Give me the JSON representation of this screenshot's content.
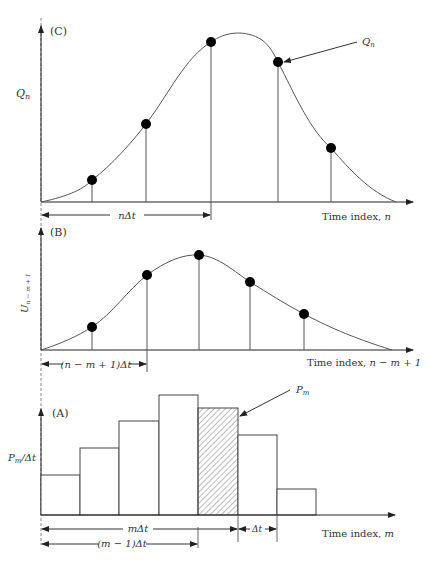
{
  "panels": {
    "C": {
      "label": "(C)",
      "y_axis_label": "Q",
      "y_axis_sub": "n",
      "x_axis_label": "Time index, ",
      "x_axis_var": "n",
      "callout_label": "Q",
      "callout_sub": "n",
      "dim_label": "nΔt",
      "points": [
        [
          92,
          180
        ],
        [
          146,
          124
        ],
        [
          211,
          42
        ],
        [
          278,
          62
        ],
        [
          331,
          148
        ]
      ]
    },
    "B": {
      "label": "(B)",
      "y_axis_label": "U",
      "y_axis_sub": "n − m + 1",
      "x_axis_label": "Time index, ",
      "x_axis_var": "n − m + 1",
      "dim_label": "(n − m + 1)Δt",
      "points": [
        [
          92,
          327
        ],
        [
          147,
          275
        ],
        [
          199,
          255
        ],
        [
          250,
          282
        ],
        [
          304,
          314
        ]
      ]
    },
    "A": {
      "label": "(A)",
      "y_axis_label": "P",
      "y_axis_sub": "m",
      "y_axis_suffix": "/Δt",
      "x_axis_label": "Time index, ",
      "x_axis_var": "m",
      "callout_label": "P",
      "callout_sub": "m",
      "dim_m": "mΔt",
      "dim_m1": "(m − 1)Δt",
      "dim_dt": "Δt",
      "bars": [
        {
          "x0": 41,
          "x1": 80,
          "top": 475,
          "hatched": false
        },
        {
          "x0": 80,
          "x1": 119,
          "top": 448,
          "hatched": false
        },
        {
          "x0": 119,
          "x1": 159,
          "top": 421,
          "hatched": false
        },
        {
          "x0": 159,
          "x1": 198,
          "top": 395,
          "hatched": false
        },
        {
          "x0": 198,
          "x1": 238,
          "top": 408,
          "hatched": true
        },
        {
          "x0": 238,
          "x1": 277,
          "top": 435,
          "hatched": false
        },
        {
          "x0": 277,
          "x1": 316,
          "top": 489,
          "hatched": false
        }
      ]
    }
  }
}
